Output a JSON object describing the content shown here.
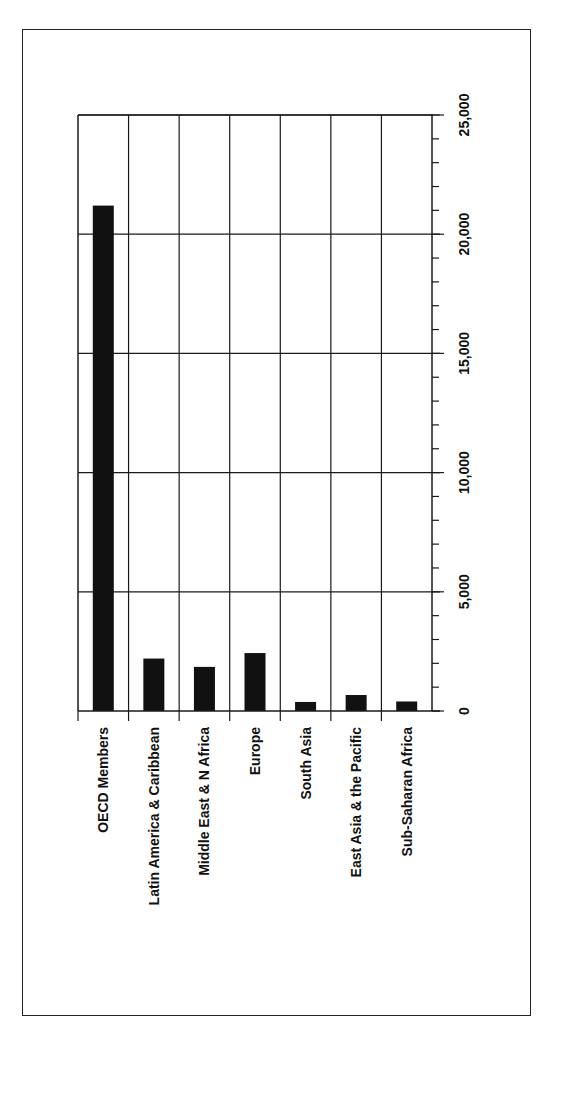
{
  "chart_data": {
    "type": "bar",
    "orientation": "vertical bars, figure rotated 90° clockwise (labels read bottom-to-top)",
    "title": "",
    "xlabel": "",
    "ylabel": "",
    "categories": [
      "OECD Members",
      "Latin America & Caribbean",
      "Middle East & N Africa",
      "Europe",
      "South Asia",
      "East Asia & the Pacific",
      "Sub-Saharan Africa"
    ],
    "values": [
      21200,
      2200,
      1850,
      2430,
      380,
      670,
      400
    ],
    "ylim": [
      0,
      25000
    ],
    "y_ticks": [
      0,
      5000,
      10000,
      15000,
      20000,
      25000
    ],
    "y_tick_labels": [
      "0",
      "5,000",
      "10,000",
      "15,000",
      "20,000",
      "25,000"
    ],
    "minor_tick_step": 1000,
    "grid": true,
    "legend": null,
    "bar_color": "#111111"
  }
}
